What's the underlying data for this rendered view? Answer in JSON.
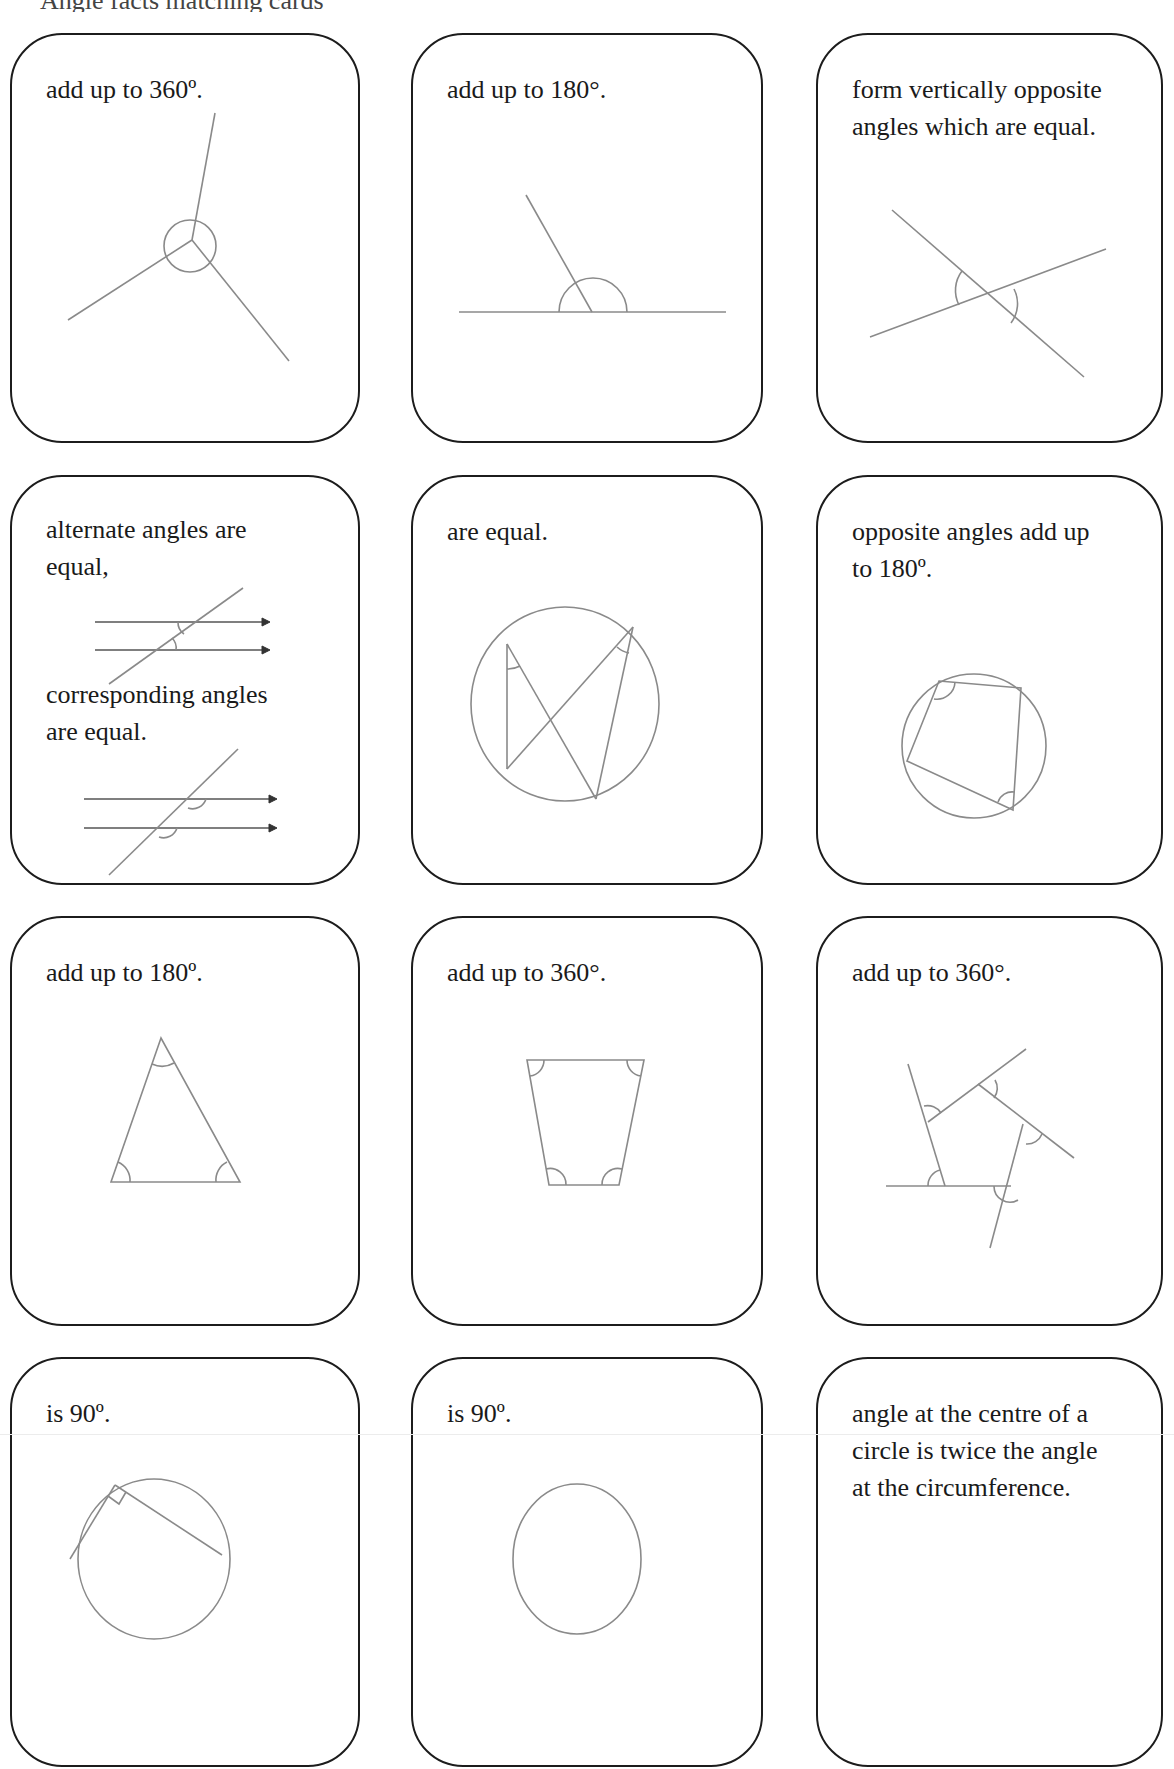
{
  "page": {
    "top_strip_text": "Angle facts matching cards"
  },
  "cards": [
    {
      "id": 1,
      "lines": [
        "add up to 360º."
      ],
      "diagram": "angles-at-a-point"
    },
    {
      "id": 2,
      "lines": [
        "add up to 180°."
      ],
      "diagram": "angles-on-straight-line"
    },
    {
      "id": 3,
      "lines": [
        "form vertically opposite",
        "angles which are equal."
      ],
      "diagram": "vertically-opposite-angles"
    },
    {
      "id": 4,
      "lines": [
        "alternate angles are",
        "equal,"
      ],
      "lines2": [
        "corresponding angles",
        "are equal."
      ],
      "diagram": "parallel-lines-alternate-corresponding"
    },
    {
      "id": 5,
      "lines": [
        "are equal."
      ],
      "diagram": "angles-in-same-segment"
    },
    {
      "id": 6,
      "lines": [
        "opposite angles add up",
        "to 180º."
      ],
      "diagram": "cyclic-quadrilateral"
    },
    {
      "id": 7,
      "lines": [
        "add up to 180º."
      ],
      "diagram": "triangle-interior-angles"
    },
    {
      "id": 8,
      "lines": [
        "add up to 360°."
      ],
      "diagram": "quadrilateral-interior-angles"
    },
    {
      "id": 9,
      "lines": [
        "add up to 360°."
      ],
      "diagram": "polygon-exterior-angles"
    },
    {
      "id": 10,
      "lines": [
        "is 90º."
      ],
      "diagram": "angle-in-semicircle"
    },
    {
      "id": 11,
      "lines": [
        "is 90º."
      ],
      "diagram": "tangent-radius-circle"
    },
    {
      "id": 12,
      "lines": [
        "angle at the centre of a",
        "circle is twice the angle",
        "at the circumference."
      ],
      "diagram": "none-visible"
    }
  ],
  "colors": {
    "card_border": "#1c1c1c",
    "diagram_stroke": "#8a8a8a",
    "text": "#1a1a1a"
  }
}
